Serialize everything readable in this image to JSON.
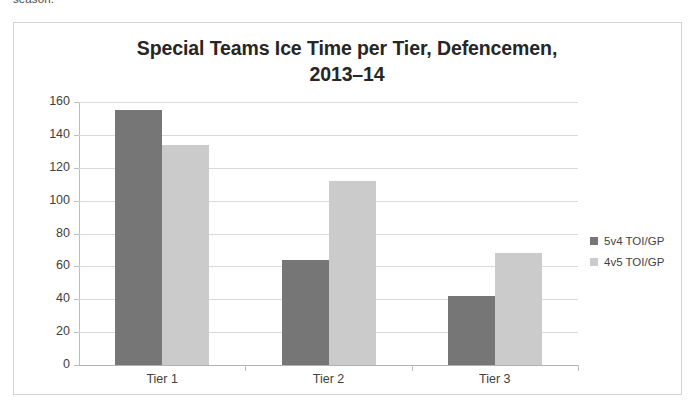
{
  "page": {
    "cropped_text_above": "season."
  },
  "chart_data": {
    "type": "bar",
    "title": "Special Teams Ice Time per Tier, Defencemen, 2013–14",
    "title_line1": "Special Teams Ice Time per Tier, Defencemen,",
    "title_line2": "2013–14",
    "xlabel": "",
    "ylabel": "",
    "categories": [
      "Tier 1",
      "Tier 2",
      "Tier 3"
    ],
    "series": [
      {
        "name": "5v4 TOI/GP",
        "color": "#767676",
        "values": [
          155,
          64,
          42
        ]
      },
      {
        "name": "4v5 TOI/GP",
        "color": "#cbcbcb",
        "values": [
          134,
          112,
          68
        ]
      }
    ],
    "ylim": [
      0,
      160
    ],
    "yticks": [
      0,
      20,
      40,
      60,
      80,
      100,
      120,
      140,
      160
    ],
    "ytick_labels": [
      "0",
      "20",
      "40",
      "60",
      "80",
      "100",
      "120",
      "140",
      "160"
    ],
    "grid": true,
    "legend_position": "right",
    "legend": [
      "5v4 TOI/GP",
      "4v5 TOI/GP"
    ]
  }
}
